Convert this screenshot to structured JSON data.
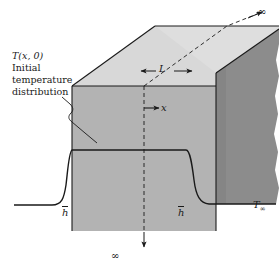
{
  "figure": {
    "width": 279,
    "height": 268,
    "background": "#ffffff"
  },
  "colors": {
    "top_face": "#d8d8d8",
    "front_face": "#b3b3b3",
    "right_face": "#8c8c8c",
    "line": "#1a1a1a",
    "text": "#1a1a1a",
    "background": "#ffffff"
  },
  "annotations": {
    "initial_temperature": {
      "line1": "T(x, 0)",
      "line2": "Initial",
      "line3": "temperature",
      "line4": "distribution"
    },
    "thickness_label": "L",
    "axis_label": "x",
    "infinity_top": "∞",
    "infinity_bottom": "∞",
    "convection_left": "h",
    "convection_right": "h",
    "ambient_temperature": "T",
    "ambient_subscript": "∞"
  },
  "geometry": {
    "slab_thickness_label": "L",
    "extends_to_infinity": [
      "top-right depth direction",
      "downward"
    ],
    "faces": [
      "top",
      "front",
      "right"
    ]
  }
}
